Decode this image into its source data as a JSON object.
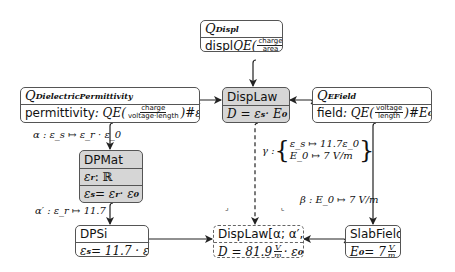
{
  "nodes": {
    "q_displ": {
      "title": "Q",
      "title_sub": "Displ",
      "body_prefix": "displ",
      "body_qe": "QE(",
      "frac_num": "charge",
      "frac_den": "area",
      "body_suffix": ")#D"
    },
    "q_dielectric": {
      "title": "Q",
      "title_sub": "DielectricPermittivity",
      "body_prefix": "permittivity",
      "body_qe": " : QE(",
      "frac_num": "charge",
      "frac_den": "voltage·length",
      "body_suffix": ")#ε",
      "body_suffix_sub": "s"
    },
    "displaw": {
      "title": "DispLaw",
      "equation": "D = ε",
      "equation_sub": "s",
      "equation_rest": " · E",
      "equation_rest_sub": "0"
    },
    "q_efield": {
      "title": "Q",
      "title_sub": "EField",
      "body_prefix": "field",
      "body_qe": " : QE(",
      "frac_num": "voltage",
      "frac_den": "length",
      "body_suffix": ")#E",
      "body_suffix_sub": "0"
    },
    "dpmat": {
      "title": "DPMat",
      "row1": "ε",
      "row1_sub": "r",
      "row1_rest": " : ℝ",
      "row2": "ε",
      "row2_sub": "s",
      "row2_mid": " = ε",
      "row2_mid_sub": "r",
      "row2_rest": " · ε",
      "row2_rest_sub": "0"
    },
    "dpsi": {
      "title": "DPSi",
      "eq": "ε",
      "eq_sub": "s",
      "eq_rest": " = 11.7 · ε",
      "eq_rest_sub": "0"
    },
    "displaw_inst": {
      "title": "DispLaw[α; α′, β]",
      "eq": "D = 81.9",
      "frac_num": "V",
      "frac_den": "m",
      "eq_rest": " · ε",
      "eq_rest_sub": "0"
    },
    "slabfield": {
      "title": "SlabField",
      "eq": "E",
      "eq_sub": "0",
      "eq_rest": " = 7",
      "frac_num": "V",
      "frac_den": "m"
    }
  },
  "edge_labels": {
    "alpha": "α : ε_s ↦ ε_r · ε_0",
    "alpha_prime": "α′ : ε_r ↦ 11.7",
    "beta": "β : E_0 ↦ 7 V/m",
    "gamma_name": "γ :",
    "gamma_line1": "ε_s ↦ 11.7ε_0",
    "gamma_line2": "E_0 ↦ 7 V/m"
  },
  "marks": {
    "left": "⌟",
    "right": "⌞"
  },
  "colors": {
    "gray_fill": "#d6d6d6",
    "border": "#555555",
    "arrow": "#222222"
  }
}
